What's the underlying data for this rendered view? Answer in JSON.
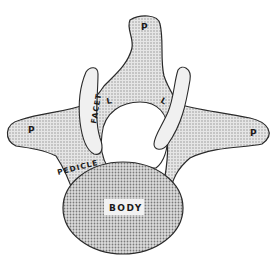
{
  "diagram": {
    "labels": {
      "process_top": "P",
      "process_left": "P",
      "process_right": "P",
      "facet": "FACET",
      "lamina_left": "L",
      "lamina_right": "L",
      "pedicle": "PEDICLE",
      "body": "BODY"
    },
    "colors": {
      "stroke": "#2a2a2a",
      "fill_stipple": "#d4d4d4",
      "fill_body": "#c8c8c8",
      "background": "#ffffff"
    }
  }
}
